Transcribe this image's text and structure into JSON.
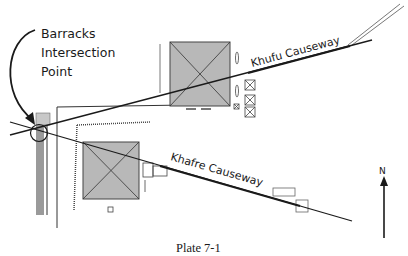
{
  "labels": {
    "intersection_line1": "Barracks",
    "intersection_line2": "Intersection",
    "intersection_line3": "Point",
    "khufu_causeway": "Khufu Causeway",
    "khafre_causeway": "Khafre Causeway",
    "north": "N"
  },
  "caption": "Plate 7-1",
  "colors": {
    "pyramid_fill": "#b8b8b8",
    "line": "#1a1a1a",
    "barracks_fill": "#9a9a9a"
  }
}
